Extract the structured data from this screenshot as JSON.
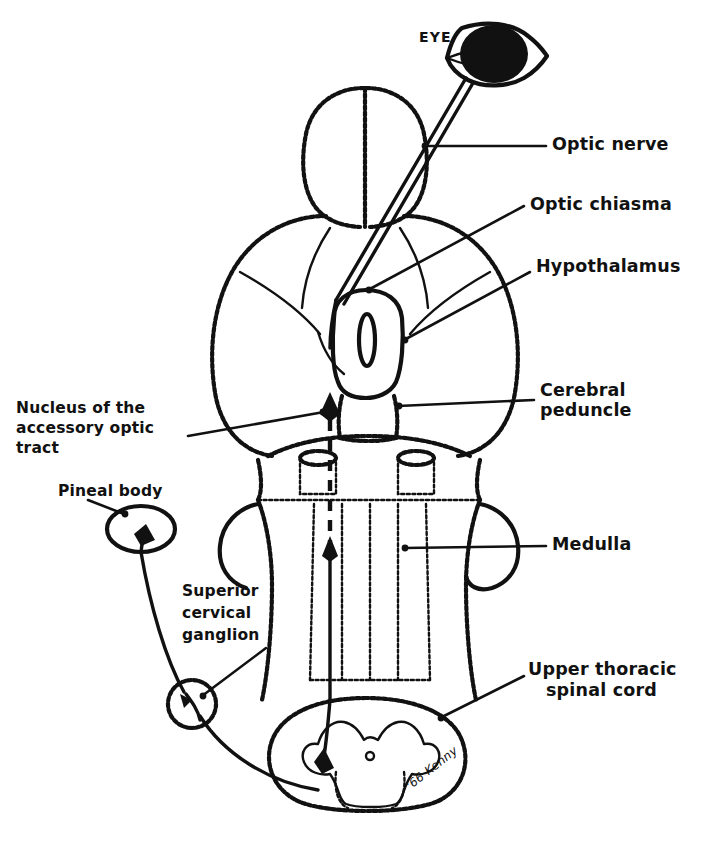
{
  "figure": {
    "signature": "'66 Kenny",
    "ink_color": "#111111",
    "background_color": "#ffffff"
  },
  "labels": {
    "eye": "EYE",
    "optic_nerve": "Optic nerve",
    "optic_chiasma": "Optic chiasma",
    "hypothalamus": "Hypothalamus",
    "cerebral_peduncle_line1": "Cerebral",
    "cerebral_peduncle_line2": "peduncle",
    "medulla": "Medulla",
    "upper_thoracic_line1": "Upper thoracic",
    "upper_thoracic_line2": "spinal cord",
    "nucleus_line1": "Nucleus of the",
    "nucleus_line2": "accessory optic",
    "nucleus_line3": "tract",
    "pineal_body": "Pineal body",
    "ganglion_line1": "Superior",
    "ganglion_line2": "cervical",
    "ganglion_line3": "ganglion"
  },
  "structures": [
    {
      "name": "eye",
      "description": "filled black eyeball with lens outline"
    },
    {
      "name": "optic-nerve",
      "description": "double-line tract from eye to chiasma"
    },
    {
      "name": "cerebral-hemispheres",
      "description": "paired oval lobes at top"
    },
    {
      "name": "optic-chiasma",
      "description": "crossing point of optic nerves"
    },
    {
      "name": "hypothalamus",
      "description": "central oval body"
    },
    {
      "name": "cerebral-peduncle",
      "description": "paired stalks below hypothalamus"
    },
    {
      "name": "medulla",
      "description": "brainstem with longitudinal tracts"
    },
    {
      "name": "upper-thoracic-spinal-cord",
      "description": "cross-section with butterfly gray matter"
    },
    {
      "name": "nucleus-accessory-optic-tract",
      "description": "arrow target in midbrain"
    },
    {
      "name": "pineal-body",
      "description": "ellipse at upper left"
    },
    {
      "name": "superior-cervical-ganglion",
      "description": "dotted circle with synapse"
    },
    {
      "name": "ascending-pathway",
      "description": "solid and dashed arrowed tract"
    }
  ]
}
